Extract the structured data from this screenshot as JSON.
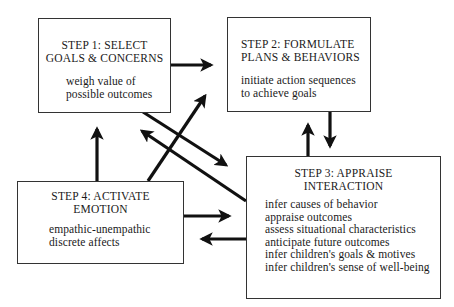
{
  "diagram": {
    "type": "flow-cycle",
    "boxes": {
      "step1": {
        "title": [
          "STEP 1: SELECT",
          "GOALS & CONCERNS"
        ],
        "body": [
          "weigh value of",
          "possible outcomes"
        ]
      },
      "step2": {
        "title": [
          "STEP 2: FORMULATE",
          "PLANS & BEHAVIORS"
        ],
        "body": [
          "initiate action sequences",
          "to achieve goals"
        ]
      },
      "step3": {
        "title": [
          "STEP 3: APPRAISE",
          "INTERACTION"
        ],
        "body": [
          "infer causes of behavior",
          "appraise outcomes",
          "assess situational characteristics",
          "anticipate future outcomes",
          "infer children's goals & motives",
          "infer children's sense of well-being"
        ]
      },
      "step4": {
        "title": [
          "STEP 4: ACTIVATE",
          "EMOTION"
        ],
        "body": [
          "empathic-unempathic",
          "discrete affects"
        ]
      }
    },
    "edges": [
      {
        "from": "step1",
        "to": "step2"
      },
      {
        "from": "step2",
        "to": "step3"
      },
      {
        "from": "step3",
        "to": "step2"
      },
      {
        "from": "step1",
        "to": "step3"
      },
      {
        "from": "step3",
        "to": "step1"
      },
      {
        "from": "step4",
        "to": "step2"
      },
      {
        "from": "step4",
        "to": "step1"
      },
      {
        "from": "step4",
        "to": "step3"
      },
      {
        "from": "step3",
        "to": "step4"
      }
    ],
    "colors": {
      "stroke": "#111111",
      "box_border": "#333333",
      "background": "#ffffff"
    }
  }
}
